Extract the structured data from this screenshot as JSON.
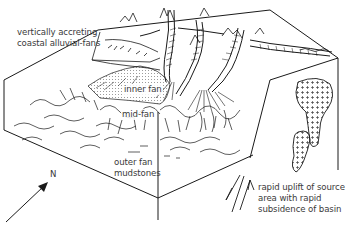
{
  "diagram": {
    "type": "geological block diagram",
    "labels": {
      "coastal": [
        "vertically accreting",
        "coastal alluvial-fans"
      ],
      "inner_fan": "inner fan",
      "mid_fan": "mid-fan",
      "outer_fan": [
        "outer fan",
        "mudstones"
      ],
      "north": "N",
      "uplift": [
        "rapid uplift of source",
        "area with rapid",
        "subsidence of basin"
      ]
    },
    "symbols": {
      "north_arrow": "arrow-up-right",
      "fault_arrows": "up-down-fault-arrows",
      "intrusion_pattern": "cross-hatched plutons"
    },
    "colors": {
      "line": "#1a1a1a",
      "text": "#3a3a3a",
      "background": "#ffffff"
    }
  }
}
